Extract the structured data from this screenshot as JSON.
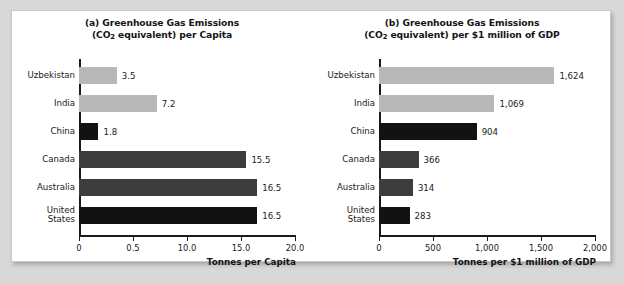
{
  "chart_data": [
    {
      "type": "bar",
      "panel": "a",
      "title_line1": "(a) Greenhouse Gas Emissions",
      "title_line2_pre": "(CO",
      "title_line2_sub": "2",
      "title_line2_post": " equivalent) per Capita",
      "orientation": "horizontal",
      "categories": [
        "Uzbekistan",
        "India",
        "China",
        "Canada",
        "Australia",
        "United\nStates"
      ],
      "values": [
        3.5,
        7.2,
        1.8,
        15.5,
        16.5,
        16.5
      ],
      "value_labels": [
        "3.5",
        "7.2",
        "1.8",
        "15.5",
        "16.5",
        "16.5"
      ],
      "bar_shades": [
        "light",
        "light",
        "black",
        "dark",
        "dark",
        "black"
      ],
      "xlabel": "Tonnes per Capita",
      "ylabel": "",
      "xlim": [
        0,
        20
      ],
      "tick_values": [
        0,
        5,
        10,
        15,
        20
      ],
      "tick_labels": [
        "0",
        "0.5",
        "10.0",
        "15.0",
        "20.0"
      ],
      "grid": false,
      "legend": "none"
    },
    {
      "type": "bar",
      "panel": "b",
      "title_line1": "(b) Greenhouse Gas Emissions",
      "title_line2_pre": "(CO",
      "title_line2_sub": "2",
      "title_line2_post": " equivalent) per $1 million of GDP",
      "orientation": "horizontal",
      "categories": [
        "Uzbekistan",
        "India",
        "China",
        "Canada",
        "Australia",
        "United\nStates"
      ],
      "values": [
        1624,
        1069,
        904,
        366,
        314,
        283
      ],
      "value_labels": [
        "1,624",
        "1,069",
        "904",
        "366",
        "314",
        "283"
      ],
      "bar_shades": [
        "light",
        "light",
        "black",
        "dark",
        "dark",
        "black"
      ],
      "xlabel": "Tonnes per $1 million of GDP",
      "ylabel": "",
      "xlim": [
        0,
        2000
      ],
      "tick_values": [
        0,
        500,
        1000,
        1500,
        2000
      ],
      "tick_labels": [
        "0",
        "500",
        "1,000",
        "1,500",
        "2,000"
      ],
      "grid": false,
      "legend": "none"
    }
  ],
  "colors": {
    "page_background": "#d8d8d8",
    "card_background": "#ffffff",
    "bar_light": "#b8b8b8",
    "bar_dark": "#3d3d3d",
    "bar_black": "#121212",
    "axis": "#1a1a1a",
    "text": "#1a1a1a"
  }
}
